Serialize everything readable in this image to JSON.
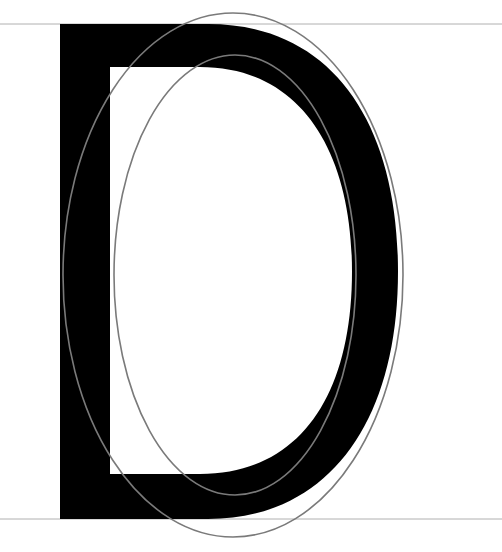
{
  "diagram": {
    "colors": {
      "background": "#ffffff",
      "glyph": "#000000",
      "ellipse_stroke": "#7a7a7a",
      "guide_line": "#b0b0b0"
    },
    "guides": {
      "cap_height_y": 24,
      "baseline_y": 519
    },
    "glyph": {
      "letter": "D",
      "stem": {
        "x1": 60,
        "x2": 110
      },
      "counter": {
        "top": 67,
        "bottom": 474
      },
      "bowl": {
        "outer_right": 398,
        "inner_right": 352
      }
    },
    "ellipses": [
      {
        "name": "outer-ellipse",
        "cx": 233,
        "cy": 275,
        "rx": 170,
        "ry": 262
      },
      {
        "name": "inner-ellipse",
        "cx": 235,
        "cy": 275,
        "rx": 121,
        "ry": 220
      }
    ]
  }
}
